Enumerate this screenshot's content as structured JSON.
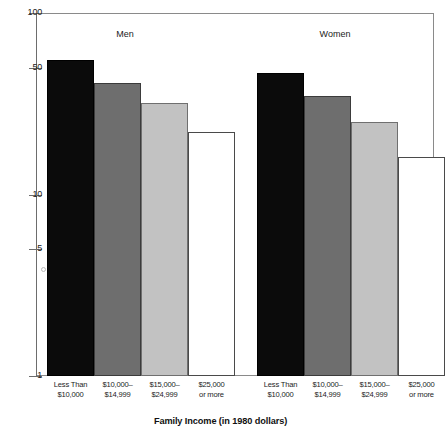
{
  "chart_data": {
    "type": "bar",
    "title": "",
    "xlabel": "Family Income (in 1980 dollars)",
    "ylabel": "",
    "yscale": "log",
    "ylim": [
      1,
      100
    ],
    "ytick_labels": [
      "100",
      "50",
      "10",
      "5",
      "1"
    ],
    "ytick_values": [
      100,
      50,
      10,
      5,
      1
    ],
    "grid": false,
    "legend": "none",
    "groups": [
      "Men",
      "Women"
    ],
    "categories": [
      "Less Than $10,000",
      "$10,000–$14,999",
      "$15,000–$24,999",
      "$25,000 or more"
    ],
    "category_lines": [
      {
        "line1": "Less Than",
        "line2": "$10,000"
      },
      {
        "line1": "$10,000–",
        "line2": "$14,999"
      },
      {
        "line1": "$15,000–",
        "line2": "$24,999"
      },
      {
        "line1": "$25,000",
        "line2": "or more"
      }
    ],
    "series": [
      {
        "name": "Men",
        "values": [
          55,
          41,
          32,
          22
        ]
      },
      {
        "name": "Women",
        "values": [
          47,
          35,
          25,
          16
        ]
      }
    ],
    "bar_styles": [
      "solid-black",
      "dark-gray",
      "light-gray",
      "white-fill"
    ],
    "bar_colors": [
      "#0b0b0b",
      "#6e6e6e",
      "#c2c2c2",
      "#ffffff"
    ]
  },
  "axis": {
    "y_ticks": [
      {
        "label": "100",
        "value": 100
      },
      {
        "label": "50",
        "value": 50
      },
      {
        "label": "10",
        "value": 10
      },
      {
        "label": "5",
        "value": 5
      },
      {
        "label": "1",
        "value": 1
      }
    ],
    "x_title": "Family Income (in 1980 dollars)"
  },
  "groups": [
    {
      "label": "Men"
    },
    {
      "label": "Women"
    }
  ]
}
